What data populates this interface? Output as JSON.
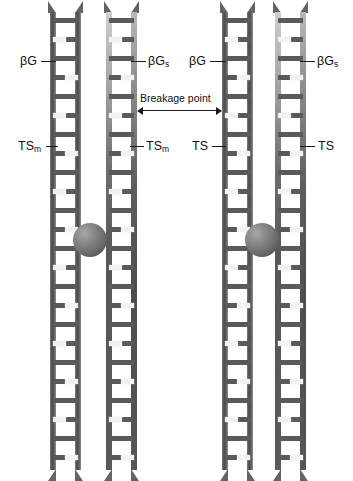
{
  "figure": {
    "title": "",
    "background_color": "#ffffff",
    "width": 353,
    "height": 481
  },
  "labels": {
    "bg_left": "βG",
    "bg_s_left": "βG",
    "bg_s_left_sub": "s",
    "bg_right": "βG",
    "bg_s_right": "βG",
    "bg_s_right_sub": "s",
    "ts_m_left": "TS",
    "ts_m_left_sub": "m",
    "ts_m_mid": "TS",
    "ts_m_mid_sub": "m",
    "ts_left2": "TS",
    "ts_right": "TS",
    "breakage_point": "Breakage point"
  },
  "colors": {
    "rail_dark": "#4a4a4a",
    "rung": "#5a5a5a",
    "highlight": "#f2f2f2",
    "sphere": "#6f6f6f",
    "text": "#111111",
    "background": "#ffffff"
  },
  "chromatids": [
    {
      "name": "chromatid-1",
      "glow": false,
      "x": 50
    },
    {
      "name": "chromatid-2",
      "glow": true,
      "x": 106
    },
    {
      "name": "chromatid-3",
      "glow": false,
      "x": 222
    },
    {
      "name": "chromatid-4",
      "glow": true,
      "x": 275
    }
  ],
  "centromeres": [
    {
      "name": "centromere-left",
      "x": 73,
      "y": 223
    },
    {
      "name": "centromere-right",
      "x": 245,
      "y": 223
    }
  ]
}
